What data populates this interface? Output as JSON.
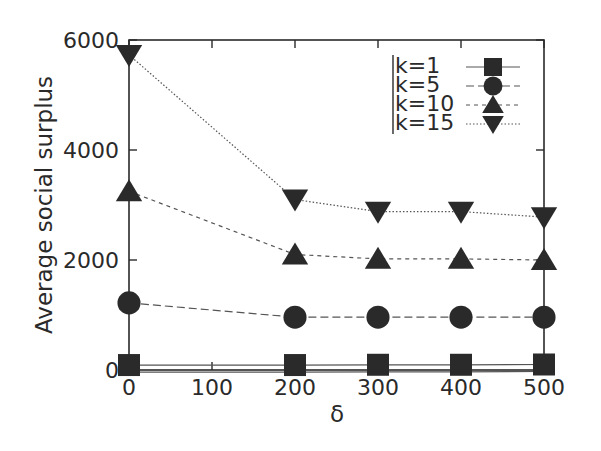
{
  "chart_data": {
    "type": "line",
    "title": "",
    "xlabel": "δ",
    "ylabel": "Average social surplus",
    "x": [
      0,
      200,
      300,
      400,
      500
    ],
    "xticks": [
      0,
      100,
      200,
      300,
      400,
      500
    ],
    "yticks": [
      0,
      2000,
      4000,
      6000
    ],
    "xlim": [
      0,
      500
    ],
    "ylim": [
      0,
      6000
    ],
    "grid": false,
    "legend_position": "upper right",
    "series": [
      {
        "name": "k=1",
        "marker": "square",
        "linestyle": "solid",
        "values": [
          90,
          90,
          95,
          95,
          100
        ]
      },
      {
        "name": "k=5",
        "marker": "circle",
        "linestyle": "dashed",
        "values": [
          1220,
          960,
          960,
          960,
          960
        ]
      },
      {
        "name": "k=10",
        "marker": "triangle-up",
        "linestyle": "dashed-short",
        "values": [
          3250,
          2100,
          2020,
          2020,
          2000
        ]
      },
      {
        "name": "k=15",
        "marker": "triangle-down",
        "linestyle": "dotted",
        "values": [
          5730,
          3100,
          2880,
          2880,
          2780
        ]
      }
    ]
  },
  "colors": {
    "ink": "#2a2a2a",
    "line": "#555555"
  }
}
